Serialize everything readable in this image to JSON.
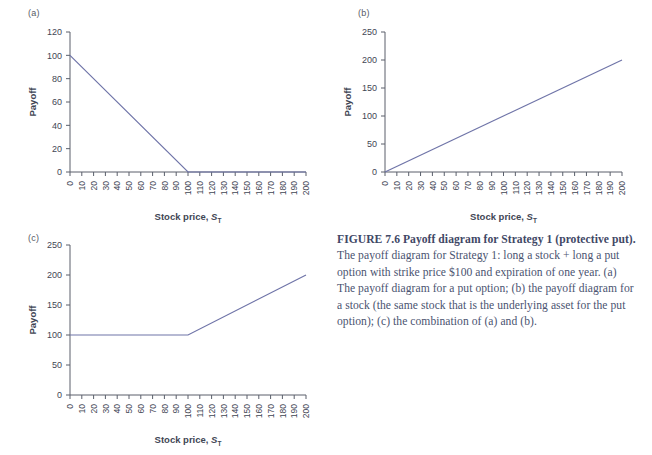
{
  "figure": {
    "caption_lead": "FIGURE 7.6  Payoff diagram for Strategy 1 (protective put).",
    "caption_body": " The payoff diagram for Strategy 1: long a stock + long a put option with strike price $100 and expiration of one year. (a) The payoff diagram for a put option; (b) the payoff diagram for a stock (the same stock that is the underlying asset for the put option); (c) the combination of (a) and (b).",
    "line_color": "#6f74a8",
    "axis_color": "#5a5f6b",
    "text_color": "#3f4654"
  },
  "panels": [
    {
      "id": "a",
      "label": "(a)",
      "ylabel": "Payoff",
      "xlabel_main": "Stock price, ",
      "xlabel_sym": "S",
      "xlabel_sub": "T"
    },
    {
      "id": "b",
      "label": "(b)",
      "ylabel": "Payoff",
      "xlabel_main": "Stock price, ",
      "xlabel_sym": "S",
      "xlabel_sub": "T"
    },
    {
      "id": "c",
      "label": "(c)",
      "ylabel": "Payoff",
      "xlabel_main": "Stock price, ",
      "xlabel_sym": "S",
      "xlabel_sub": "T"
    }
  ],
  "chart_data": [
    {
      "type": "line",
      "panel": "a",
      "title": "(a) Payoff diagram for a put option",
      "xlabel": "Stock price, S_T",
      "ylabel": "Payoff",
      "xlim": [
        0,
        200
      ],
      "ylim": [
        0,
        120
      ],
      "xticks": [
        0,
        10,
        20,
        30,
        40,
        50,
        60,
        70,
        80,
        90,
        100,
        110,
        120,
        130,
        140,
        150,
        160,
        170,
        180,
        190,
        200
      ],
      "yticks": [
        0,
        20,
        40,
        60,
        80,
        100,
        120
      ],
      "xtick_labels": [
        "0",
        "10",
        "20",
        "30",
        "40",
        "50",
        "60",
        "70",
        "80",
        "90",
        "100",
        "110",
        "120",
        "130",
        "140",
        "150",
        "160",
        "170",
        "180",
        "190",
        "200"
      ],
      "ytick_labels": [
        "0",
        "20",
        "40",
        "60",
        "80",
        "100",
        "120"
      ],
      "xtick_rotation": 90,
      "grid": false,
      "legend": false,
      "series": [
        {
          "name": "Long put payoff (K = 100)",
          "x": [
            0,
            100,
            200
          ],
          "y": [
            100,
            0,
            0
          ]
        }
      ]
    },
    {
      "type": "line",
      "panel": "b",
      "title": "(b) Payoff diagram for a stock",
      "xlabel": "Stock price, S_T",
      "ylabel": "Payoff",
      "xlim": [
        0,
        200
      ],
      "ylim": [
        0,
        250
      ],
      "xticks": [
        0,
        10,
        20,
        30,
        40,
        50,
        60,
        70,
        80,
        90,
        100,
        110,
        120,
        130,
        140,
        150,
        160,
        170,
        180,
        190,
        200
      ],
      "yticks": [
        0,
        50,
        100,
        150,
        200,
        250
      ],
      "xtick_labels": [
        "0",
        "10",
        "20",
        "30",
        "40",
        "50",
        "60",
        "70",
        "80",
        "90",
        "100",
        "110",
        "120",
        "130",
        "140",
        "150",
        "160",
        "170",
        "180",
        "190",
        "200"
      ],
      "ytick_labels": [
        "0",
        "50",
        "100",
        "150",
        "200",
        "250"
      ],
      "xtick_rotation": 90,
      "grid": false,
      "legend": false,
      "series": [
        {
          "name": "Long stock payoff",
          "x": [
            0,
            200
          ],
          "y": [
            0,
            200
          ]
        }
      ]
    },
    {
      "type": "line",
      "panel": "c",
      "title": "(c) Protective put: combination of (a) and (b)",
      "xlabel": "Stock price, S_T",
      "ylabel": "Payoff",
      "xlim": [
        0,
        200
      ],
      "ylim": [
        0,
        250
      ],
      "xticks": [
        0,
        10,
        20,
        30,
        40,
        50,
        60,
        70,
        80,
        90,
        100,
        110,
        120,
        130,
        140,
        150,
        160,
        170,
        180,
        190,
        200
      ],
      "yticks": [
        0,
        50,
        100,
        150,
        200,
        250
      ],
      "xtick_labels": [
        "0",
        "10",
        "20",
        "30",
        "40",
        "50",
        "60",
        "70",
        "80",
        "90",
        "100",
        "110",
        "120",
        "130",
        "140",
        "150",
        "160",
        "170",
        "180",
        "190",
        "200"
      ],
      "ytick_labels": [
        "0",
        "50",
        "100",
        "150",
        "200",
        "250"
      ],
      "xtick_rotation": 90,
      "grid": false,
      "legend": false,
      "series": [
        {
          "name": "Protective put payoff",
          "x": [
            0,
            100,
            200
          ],
          "y": [
            100,
            100,
            200
          ]
        }
      ]
    }
  ]
}
